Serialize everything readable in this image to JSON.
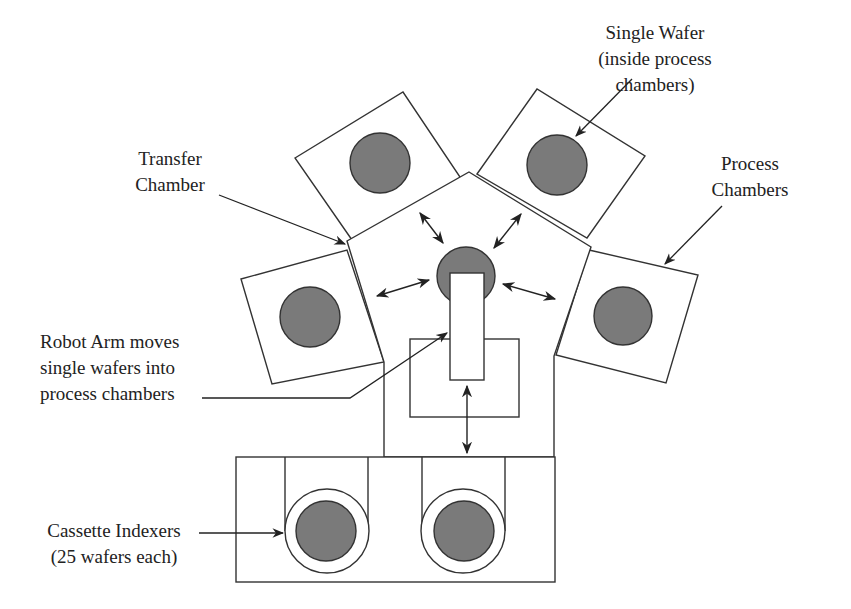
{
  "colors": {
    "line": "#333333",
    "wafer_fill": "#7a7a7a",
    "background": "#ffffff",
    "text": "#222222"
  },
  "labels": {
    "single_wafer": {
      "lines": [
        "Single Wafer",
        "(inside process",
        "chambers)"
      ]
    },
    "transfer_chamber": {
      "lines": [
        "Transfer",
        "Chamber"
      ]
    },
    "process_chambers": {
      "lines": [
        "Process",
        "Chambers"
      ]
    },
    "robot_arm": {
      "lines": [
        "Robot Arm moves",
        "single wafers into",
        "process chambers"
      ]
    },
    "cassette_indexers": {
      "lines": [
        "Cassette Indexers",
        "(25 wafers each)"
      ]
    }
  },
  "components": {
    "process_chamber_count": 4,
    "cassette_indexer_count": 2,
    "transfer_chamber_shape": "pentagon",
    "robot_arm_arrows": 5
  }
}
